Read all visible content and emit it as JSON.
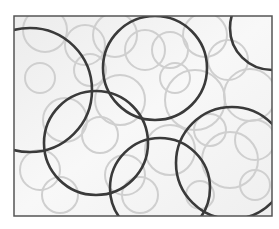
{
  "image": {
    "description": "Rectangular framed pattern of overlapping circles: several large dark-gray outlined circles over many lighter gray outlined circles on a pale background",
    "frame": {
      "x": 14,
      "y": 16,
      "width": 258,
      "height": 200,
      "stroke": "#555555",
      "fill": "#f3f3f3"
    },
    "colors": {
      "dark_ring": "#3a3a3a",
      "light_ring": "#cfcfcf",
      "background": "#f4f4f4"
    },
    "dark_circles": [
      {
        "cx": 30,
        "cy": 90,
        "r": 62
      },
      {
        "cx": 155,
        "cy": 68,
        "r": 52
      },
      {
        "cx": 272,
        "cy": 28,
        "r": 42
      },
      {
        "cx": 96,
        "cy": 143,
        "r": 52
      },
      {
        "cx": 160,
        "cy": 188,
        "r": 50
      },
      {
        "cx": 232,
        "cy": 163,
        "r": 56
      }
    ],
    "light_circles": [
      {
        "cx": 45,
        "cy": 30,
        "r": 22
      },
      {
        "cx": 85,
        "cy": 45,
        "r": 20
      },
      {
        "cx": 40,
        "cy": 78,
        "r": 15
      },
      {
        "cx": 115,
        "cy": 35,
        "r": 22
      },
      {
        "cx": 145,
        "cy": 50,
        "r": 20
      },
      {
        "cx": 170,
        "cy": 50,
        "r": 18
      },
      {
        "cx": 205,
        "cy": 35,
        "r": 22
      },
      {
        "cx": 228,
        "cy": 60,
        "r": 20
      },
      {
        "cx": 250,
        "cy": 95,
        "r": 26
      },
      {
        "cx": 195,
        "cy": 100,
        "r": 30
      },
      {
        "cx": 175,
        "cy": 78,
        "r": 15
      },
      {
        "cx": 120,
        "cy": 100,
        "r": 25
      },
      {
        "cx": 65,
        "cy": 120,
        "r": 22
      },
      {
        "cx": 100,
        "cy": 135,
        "r": 18
      },
      {
        "cx": 40,
        "cy": 170,
        "r": 20
      },
      {
        "cx": 60,
        "cy": 195,
        "r": 18
      },
      {
        "cx": 125,
        "cy": 175,
        "r": 20
      },
      {
        "cx": 170,
        "cy": 150,
        "r": 25
      },
      {
        "cx": 210,
        "cy": 130,
        "r": 16
      },
      {
        "cx": 230,
        "cy": 160,
        "r": 28
      },
      {
        "cx": 255,
        "cy": 185,
        "r": 15
      },
      {
        "cx": 200,
        "cy": 195,
        "r": 14
      },
      {
        "cx": 140,
        "cy": 195,
        "r": 18
      },
      {
        "cx": 90,
        "cy": 70,
        "r": 16
      },
      {
        "cx": 255,
        "cy": 140,
        "r": 20
      }
    ]
  }
}
